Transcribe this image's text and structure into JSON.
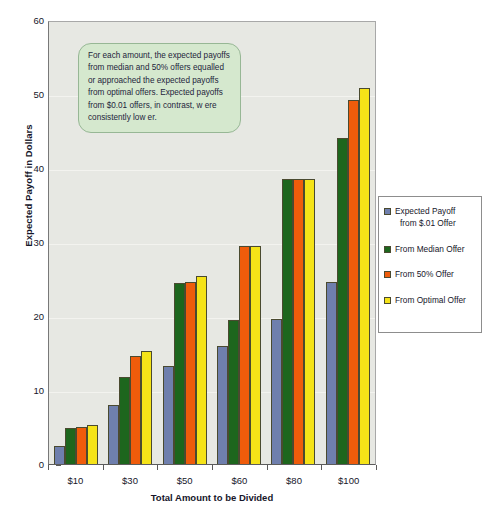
{
  "chart_data": {
    "type": "bar",
    "title": "",
    "xlabel": "Total Amount to be Divided",
    "ylabel": "Expected Payoff in Dollars",
    "categories": [
      "$10",
      "$30",
      "$50",
      "$60",
      "$80",
      "$100"
    ],
    "ylim": [
      0,
      60
    ],
    "yticks": [
      0,
      10,
      20,
      30,
      40,
      50,
      60
    ],
    "grid": true,
    "legend_position": "right",
    "series": [
      {
        "name": "Expected Payoff from $.01 Offer",
        "color": "#6f7fad",
        "values": [
          2.5,
          8.0,
          13.3,
          15.9,
          19.6,
          24.6
        ]
      },
      {
        "name": "From Median Offer",
        "color": "#1d661d",
        "values": [
          4.9,
          11.8,
          24.5,
          19.4,
          38.5,
          44.0
        ]
      },
      {
        "name": "From 50% Offer",
        "color": "#ef5c0b",
        "values": [
          5.0,
          14.6,
          24.6,
          29.4,
          38.5,
          49.2
        ]
      },
      {
        "name": "From Optimal Offer",
        "color": "#f5e318",
        "values": [
          5.3,
          15.3,
          25.4,
          29.4,
          38.5,
          50.8
        ]
      }
    ],
    "annotation": "For each amount, the expected payoffs from median and 50% offers equalled or approached the expected payoffs from optimal offers.  Expected payoffs from $0.01 offers, in contrast, w ere consistently low er."
  },
  "legend": {
    "entries": [
      {
        "label_line1": "Expected Payoff",
        "label_line2": "from $.01 Offer"
      },
      {
        "label_line1": "From Median Offer",
        "label_line2": ""
      },
      {
        "label_line1": "From 50% Offer",
        "label_line2": ""
      },
      {
        "label_line1": "From Optimal Offer",
        "label_line2": ""
      }
    ]
  },
  "colors": {
    "plot_background": "#e7e8e3",
    "annotation_fill": "#d5e8ce",
    "annotation_border": "#97b795",
    "series_blue": "#6f7fad",
    "series_green": "#1d661d",
    "series_orange": "#ef5c0b",
    "series_yellow": "#f5e318"
  }
}
